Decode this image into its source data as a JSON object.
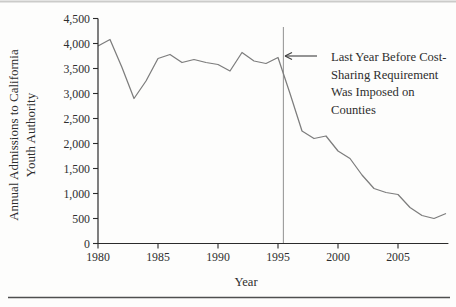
{
  "chart_data": {
    "type": "line",
    "title": "",
    "xlabel": "Year",
    "ylabel_lines": [
      "Annual Admissions to California",
      "Youth Authority"
    ],
    "x": [
      1980,
      1981,
      1982,
      1983,
      1984,
      1985,
      1986,
      1987,
      1988,
      1989,
      1990,
      1991,
      1992,
      1993,
      1994,
      1995,
      1996,
      1997,
      1998,
      1999,
      2000,
      2001,
      2002,
      2003,
      2004,
      2005,
      2006,
      2007,
      2008,
      2009
    ],
    "series": [
      {
        "name": "Annual admissions to California Youth Authority",
        "values": [
          3950,
          4080,
          3520,
          2900,
          3250,
          3700,
          3780,
          3620,
          3680,
          3620,
          3580,
          3450,
          3820,
          3650,
          3600,
          3720,
          3000,
          2250,
          2100,
          2150,
          1850,
          1700,
          1370,
          1100,
          1020,
          980,
          720,
          560,
          500,
          600
        ]
      }
    ],
    "xlim": [
      1980,
      2009.2
    ],
    "ylim": [
      0,
      4500
    ],
    "grid": false,
    "legend": "none",
    "xticks": {
      "values": [
        1980,
        1985,
        1990,
        1995,
        2000,
        2005
      ],
      "labels": [
        "1980",
        "1985",
        "1990",
        "1995",
        "2000",
        "2005"
      ]
    },
    "yticks": {
      "values": [
        0,
        500,
        1000,
        1500,
        2000,
        2500,
        3000,
        3500,
        4000,
        4500
      ],
      "labels": [
        "0",
        "500",
        "1,000",
        "1,500",
        "2,000",
        "2,500",
        "3,000",
        "3,500",
        "4,000",
        "4,500"
      ]
    },
    "annotation": {
      "lines": [
        "Last Year Before Cost-",
        "Sharing Requirement",
        "Was Imposed on",
        "Counties"
      ],
      "ref_year_x": 1995.45
    },
    "colors": {
      "data_line": "#7d7d7d",
      "axis": "#2b2b2b",
      "ref_line": "#9a9a9a",
      "arrow": "#3f3f3f",
      "top_rule": "#cbcbc9",
      "bottom_rule": "#4f4f4f"
    }
  }
}
